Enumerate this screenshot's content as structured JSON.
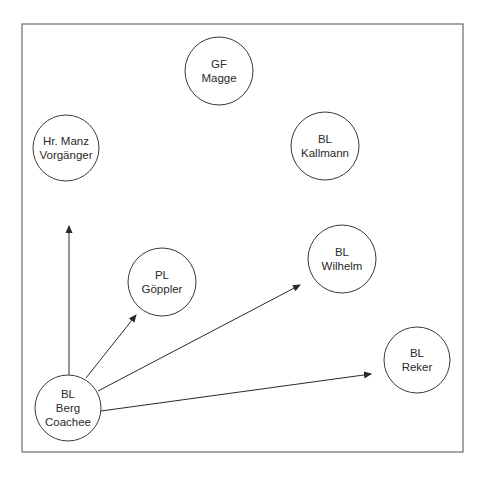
{
  "diagram": {
    "frame": {
      "x": 22,
      "y": 24,
      "width": 441,
      "height": 428
    },
    "nodes": [
      {
        "id": "gf-magge",
        "lines": [
          "GF",
          "Magge"
        ],
        "cx": 219,
        "cy": 71,
        "r": 34
      },
      {
        "id": "hr-manz",
        "lines": [
          "Hr. Manz",
          "Vorgänger"
        ],
        "cx": 66,
        "cy": 148,
        "r": 33
      },
      {
        "id": "bl-kallmann",
        "lines": [
          "BL",
          "Kallmann"
        ],
        "cx": 325,
        "cy": 146,
        "r": 34
      },
      {
        "id": "pl-goeppler",
        "lines": [
          "PL",
          "Göppler"
        ],
        "cx": 162,
        "cy": 282,
        "r": 34
      },
      {
        "id": "bl-wilhelm",
        "lines": [
          "BL",
          "Wilhelm"
        ],
        "cx": 342,
        "cy": 259,
        "r": 34
      },
      {
        "id": "bl-reker",
        "lines": [
          "BL",
          "Reker"
        ],
        "cx": 417,
        "cy": 360,
        "r": 33
      },
      {
        "id": "bl-berg",
        "lines": [
          "BL",
          "Berg",
          "Coachee"
        ],
        "cx": 68,
        "cy": 408,
        "r": 33
      }
    ],
    "edges": [
      {
        "from": "bl-berg",
        "to": "hr-manz",
        "x1": 69,
        "y1": 375,
        "x2": 69,
        "y2": 226
      },
      {
        "from": "bl-berg",
        "to": "pl-goeppler",
        "x1": 86,
        "y1": 378,
        "x2": 136,
        "y2": 315
      },
      {
        "from": "bl-berg",
        "to": "bl-wilhelm",
        "x1": 98,
        "y1": 391,
        "x2": 300,
        "y2": 285
      },
      {
        "from": "bl-berg",
        "to": "bl-reker",
        "x1": 101,
        "y1": 411,
        "x2": 371,
        "y2": 374
      }
    ]
  }
}
